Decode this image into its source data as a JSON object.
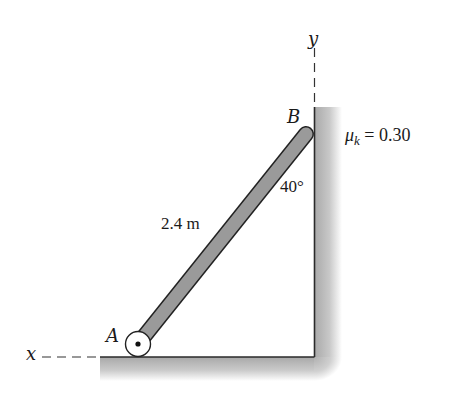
{
  "diagram": {
    "axes": {
      "x_label": "x",
      "y_label": "y"
    },
    "points": {
      "A": "A",
      "B": "B"
    },
    "bar": {
      "length_label": "2.4 m"
    },
    "angle": {
      "label": "40°"
    },
    "friction": {
      "symbol": "μ",
      "subscript": "k",
      "equals": "= 0.30"
    },
    "colors": {
      "bar_fill": "#9a9a9a",
      "outline": "#2a2a2a",
      "surface_shade": "#b5b5b5"
    }
  }
}
